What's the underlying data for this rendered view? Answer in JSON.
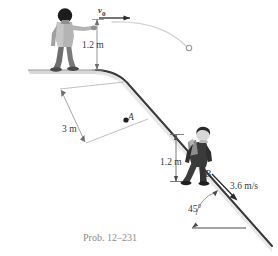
{
  "figure": {
    "caption": "Prob. 12–231",
    "labels": {
      "initial_velocity": "v",
      "initial_velocity_sub": "0",
      "height_top": "1.2 m",
      "slope_distance": "3 m",
      "point_a": "A",
      "height_b": "1.2 m",
      "point_b": "B",
      "velocity_b": "3.6 m/s",
      "slope_angle": "45°"
    },
    "colors": {
      "background": "#ffffff",
      "slope_line": "#333333",
      "ground_fill": "#d8d8d8",
      "dimension_line": "#8a8a8a",
      "trajectory": "#cfcfcf",
      "caption_text": "#8d8d8d",
      "label_text": "#3a3a3a",
      "figure_dark": "#4a4a4a",
      "figure_mid": "#9a9a9a",
      "figure_light": "#c8c8c8"
    },
    "icons": [
      "person-thrower-icon",
      "person-skier-icon",
      "ball-icon",
      "trajectory-arc-icon",
      "velocity-arrow-icon",
      "dimension-arrow-icon",
      "angle-arc-icon"
    ]
  }
}
